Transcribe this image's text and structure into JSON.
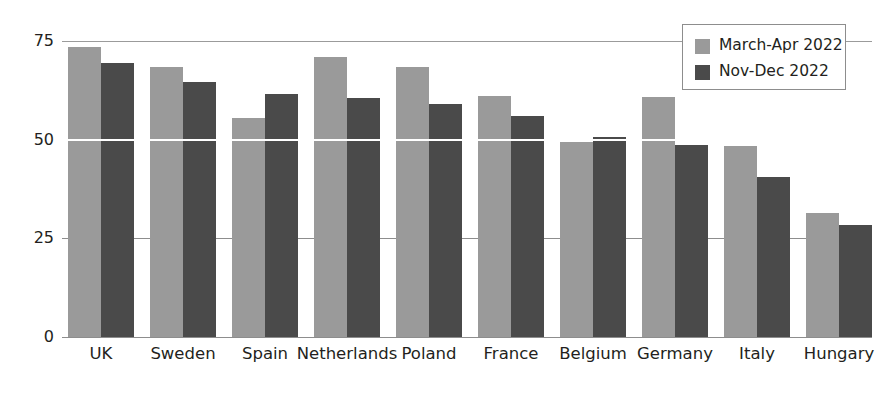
{
  "chart_data": {
    "type": "bar",
    "title": "",
    "subtitle": "",
    "xlabel": "",
    "ylabel": "",
    "ylim": [
      0,
      75
    ],
    "yticks": [
      0,
      25,
      50,
      75
    ],
    "ytick_labels": [
      "0",
      "25",
      "50",
      "75"
    ],
    "grid": true,
    "grid_axis": "y",
    "legend_position": "top-right",
    "categories": [
      "UK",
      "Sweden",
      "Spain",
      "Netherlands",
      "Poland",
      "France",
      "Belgium",
      "Germany",
      "Italy",
      "Hungary"
    ],
    "series": [
      {
        "name": "March-Apr 2022",
        "color": "#9a9a9a",
        "values": [
          73.5,
          68.5,
          55.5,
          71.0,
          68.5,
          61.0,
          49.5,
          60.8,
          48.5,
          31.5
        ]
      },
      {
        "name": "Nov-Dec 2022",
        "color": "#4a4a4a",
        "values": [
          69.5,
          64.5,
          61.5,
          60.5,
          59.0,
          56.0,
          50.8,
          48.7,
          40.5,
          28.4
        ]
      }
    ]
  },
  "legend": {
    "entries": [
      {
        "label": "March-Apr 2022",
        "color": "#9a9a9a"
      },
      {
        "label": "Nov-Dec 2022",
        "color": "#4a4a4a"
      }
    ]
  },
  "axis": {
    "y_tick_labels": [
      "75",
      "50",
      "25",
      "0"
    ],
    "x_tick_labels": [
      "UK",
      "Sweden",
      "Spain",
      "Netherlands",
      "Poland",
      "France",
      "Belgium",
      "Germany",
      "Italy",
      "Hungary"
    ]
  }
}
